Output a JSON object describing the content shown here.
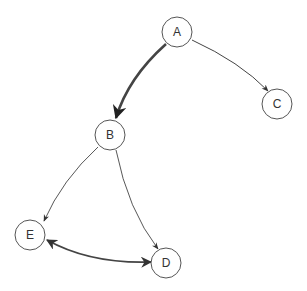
{
  "diagram": {
    "type": "directed-graph",
    "nodes": [
      {
        "id": "A",
        "label": "A",
        "x": 177,
        "y": 32
      },
      {
        "id": "B",
        "label": "B",
        "x": 110,
        "y": 135
      },
      {
        "id": "C",
        "label": "C",
        "x": 277,
        "y": 104
      },
      {
        "id": "D",
        "label": "D",
        "x": 166,
        "y": 263
      },
      {
        "id": "E",
        "label": "E",
        "x": 30,
        "y": 235
      }
    ],
    "edges": [
      {
        "from": "A",
        "to": "B",
        "weight": "thick",
        "direction": "forward"
      },
      {
        "from": "A",
        "to": "C",
        "weight": "thin",
        "direction": "forward"
      },
      {
        "from": "B",
        "to": "E",
        "weight": "thin",
        "direction": "forward"
      },
      {
        "from": "B",
        "to": "D",
        "weight": "thin",
        "direction": "forward"
      },
      {
        "from": "E",
        "to": "D",
        "weight": "medium",
        "direction": "bidirectional"
      }
    ]
  }
}
